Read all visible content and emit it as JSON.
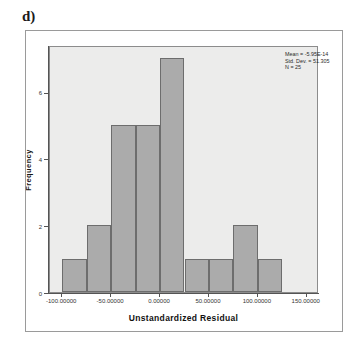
{
  "panel": {
    "letter": "d)"
  },
  "chart_data": {
    "type": "bar",
    "title": "",
    "subtitle": "",
    "xlabel": "Unstandardized Residual",
    "ylabel": "Frequency",
    "bin_width": 25,
    "bin_starts": [
      -100,
      -75,
      -50,
      -25,
      0,
      25,
      50,
      75,
      100
    ],
    "bin_ends": [
      -75,
      -50,
      -25,
      0,
      25,
      50,
      75,
      100,
      125
    ],
    "categories": [
      "-100 to -75",
      "-75 to -50",
      "-50 to -25",
      "-25 to 0",
      "0 to 25",
      "25 to 50",
      "50 to 75",
      "75 to 100",
      "100 to 125"
    ],
    "values": [
      1,
      2,
      5,
      5,
      7,
      1,
      1,
      2,
      1
    ],
    "xlim": [
      -112.5,
      162.5
    ],
    "ylim": [
      0,
      7.4
    ],
    "xticks": [
      -100,
      -50,
      0,
      50,
      100,
      150
    ],
    "xtick_labels": [
      "-100.00000",
      "-50.00000",
      "0.00000",
      "50.00000",
      "100.00000",
      "150.00000"
    ],
    "yticks": [
      0,
      2,
      4,
      6
    ],
    "ytick_labels": [
      "0",
      "2",
      "4",
      "6"
    ],
    "grid": false,
    "legend": "none",
    "bar_fill_color": "#ababab",
    "bar_edge_color": "#6d6d6d",
    "plot_background_color": "#ececeb"
  },
  "annotations": {
    "stats": [
      "Mean = -5.95E-14",
      "Std. Dev. = 51.305",
      "N = 25"
    ]
  }
}
